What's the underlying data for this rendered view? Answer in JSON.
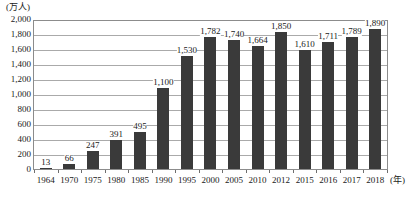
{
  "chart_data": {
    "type": "bar",
    "title": "",
    "subtitle": "",
    "xlabel": "(年)",
    "ylabel": "(万人)",
    "categories": [
      "1964",
      "1970",
      "1975",
      "1980",
      "1985",
      "1990",
      "1995",
      "2000",
      "2005",
      "2010",
      "2012",
      "2015",
      "2016",
      "2017",
      "2018"
    ],
    "values": [
      13,
      66,
      247,
      391,
      495,
      1100,
      1530,
      1782,
      1740,
      1664,
      1850,
      1610,
      1711,
      1789,
      1890
    ],
    "value_labels": [
      "13",
      "66",
      "247",
      "391",
      "495",
      "1,100",
      "1,530",
      "1,782",
      "1,740",
      "1,664",
      "1,850",
      "1,610",
      "1,711",
      "1,789",
      "1,890"
    ],
    "ylim": [
      0,
      2000
    ],
    "ytick_values": [
      0,
      200,
      400,
      600,
      800,
      1000,
      1200,
      1400,
      1600,
      1800,
      2000
    ],
    "ytick_labels": [
      "0",
      "200",
      "400",
      "600",
      "800",
      "1,000",
      "1,200",
      "1,400",
      "1,600",
      "1,800",
      "2,000"
    ],
    "grid": true,
    "legend": "none",
    "series": [
      {
        "name": "",
        "values": [
          13,
          66,
          247,
          391,
          495,
          1100,
          1530,
          1782,
          1740,
          1664,
          1850,
          1610,
          1711,
          1789,
          1890
        ]
      }
    ],
    "colors": {
      "bar": "#3a3a3a",
      "grid": "#aaaaaa",
      "frame": "#8c8c8c",
      "text": "#1a1a1a",
      "background": "#ffffff"
    }
  }
}
